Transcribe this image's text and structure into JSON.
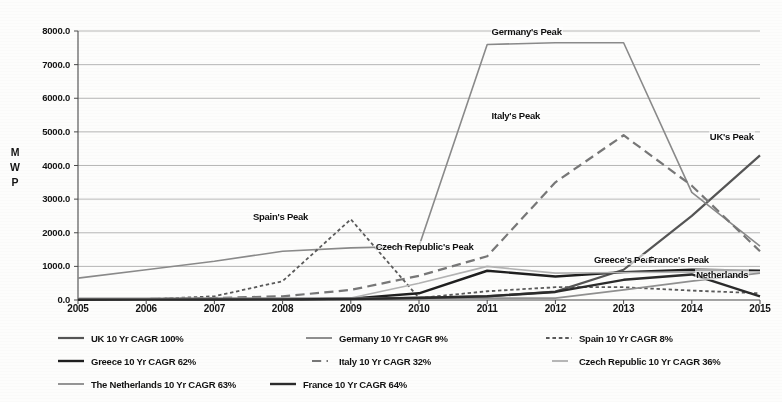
{
  "chart_data": {
    "type": "line",
    "title": "",
    "xlabel": "",
    "ylabel": "MWP",
    "ylabel_chars": [
      "M",
      "W",
      "P"
    ],
    "x": [
      2005,
      2006,
      2007,
      2008,
      2009,
      2010,
      2011,
      2012,
      2013,
      2014,
      2015
    ],
    "xtick_labels": [
      "2005",
      "2006",
      "2007",
      "2008",
      "2009",
      "2010",
      "2011",
      "2012",
      "2013",
      "2014",
      "2015"
    ],
    "ytick_labels": [
      "8000.0",
      "7000.0",
      "6000.0",
      "5000.0",
      "4000.0",
      "3000.0",
      "2000.0",
      "1000.0",
      "0.0"
    ],
    "ytick_values": [
      8000,
      7000,
      6000,
      5000,
      4000,
      3000,
      2000,
      1000,
      0
    ],
    "ylim": [
      0,
      8000
    ],
    "xlim": [
      2005,
      2015
    ],
    "grid": true,
    "grid_axis": "y",
    "legend_position": "below",
    "series": [
      {
        "name": "UK",
        "legend_label": "UK 10 Yr CAGR 100%",
        "cagr": "100%",
        "style": "solid",
        "color": "#555555",
        "width": 2.2,
        "values": [
          3,
          5,
          10,
          20,
          35,
          70,
          110,
          250,
          900,
          2500,
          4300
        ]
      },
      {
        "name": "Germany",
        "legend_label": "Germany 10 Yr CAGR 9%",
        "cagr": "9%",
        "style": "solid",
        "color": "#8a8a8a",
        "width": 1.6,
        "values": [
          650,
          900,
          1150,
          1450,
          1550,
          1600,
          7600,
          7650,
          7650,
          3200,
          1600
        ]
      },
      {
        "name": "Spain",
        "legend_label": "Spain 10 Yr CAGR 8%",
        "cagr": "8%",
        "style": "dashed-short",
        "color": "#5a5a5a",
        "width": 1.8,
        "values": [
          10,
          20,
          110,
          560,
          2400,
          60,
          260,
          380,
          380,
          280,
          200
        ]
      },
      {
        "name": "Greece",
        "legend_label": "Greece 10 Yr CAGR 62%",
        "cagr": "62%",
        "style": "solid",
        "color": "#1f1f1f",
        "width": 2.4,
        "values": [
          5,
          8,
          12,
          18,
          40,
          200,
          870,
          700,
          830,
          900,
          870
        ]
      },
      {
        "name": "Italy",
        "legend_label": "Italy 10 Yr CAGR 32%",
        "cagr": "32%",
        "style": "dashed-long",
        "color": "#777777",
        "width": 2.2,
        "values": [
          15,
          30,
          60,
          110,
          300,
          720,
          1300,
          3500,
          4900,
          3400,
          1450
        ]
      },
      {
        "name": "Czech Republic",
        "legend_label": "Czech Republic 10 Yr CAGR 36%",
        "cagr": "36%",
        "style": "solid",
        "color": "#b3b3b3",
        "width": 1.6,
        "values": [
          2,
          4,
          6,
          10,
          60,
          500,
          1000,
          800,
          820,
          830,
          840
        ]
      },
      {
        "name": "The Netherlands",
        "legend_label": "The Netherlands 10 Yr CAGR 63%",
        "cagr": "63%",
        "style": "solid",
        "color": "#909090",
        "width": 1.7,
        "values": [
          50,
          52,
          53,
          54,
          55,
          56,
          57,
          58,
          300,
          560,
          800
        ]
      },
      {
        "name": "France",
        "legend_label": "France 10 Yr CAGR 64%",
        "cagr": "64%",
        "style": "solid",
        "color": "#2b2b2b",
        "width": 2.4,
        "values": [
          8,
          10,
          14,
          20,
          30,
          60,
          110,
          240,
          600,
          760,
          110
        ]
      }
    ],
    "annotations": [
      {
        "text": "Germany's Peak",
        "x": 2011.05,
        "y": 7980
      },
      {
        "text": "Italy's Peak",
        "x": 2011.05,
        "y": 5480
      },
      {
        "text": "Spain's Peak",
        "x": 2007.55,
        "y": 2480
      },
      {
        "text": "Czech Republic's Peak",
        "x": 2009.35,
        "y": 1590
      },
      {
        "text": "Greece's Peak",
        "x": 2012.55,
        "y": 1180
      },
      {
        "text": "France's Peak",
        "x": 2013.35,
        "y": 1180
      },
      {
        "text": "UK's Peak",
        "x": 2014.25,
        "y": 4860
      },
      {
        "text": "Netherlands",
        "x": 2014.05,
        "y": 730
      }
    ]
  },
  "legend": {
    "rows": [
      [
        "UK 10 Yr CAGR 100%",
        "Germany 10 Yr CAGR 9%",
        "Spain 10 Yr CAGR 8%"
      ],
      [
        "Greece 10 Yr CAGR 62%",
        "Italy 10 Yr CAGR 32%",
        "Czech Republic 10 Yr CAGR 36%"
      ],
      [
        "The Netherlands 10 Yr CAGR 63%",
        "France 10 Yr CAGR 64%"
      ]
    ]
  }
}
